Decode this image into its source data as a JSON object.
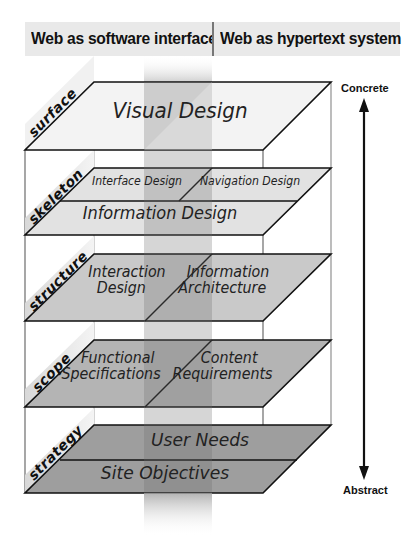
{
  "header": {
    "left": "Web as software interface",
    "right": "Web as hypertext system"
  },
  "axis": {
    "top": "Concrete",
    "bottom": "Abstract"
  },
  "planes": [
    {
      "name": "surface",
      "label": "surface",
      "elements": [
        "Visual Design"
      ]
    },
    {
      "name": "skeleton",
      "label": "skeleton",
      "elements": [
        "Interface Design",
        "Navigation Design",
        "Information Design"
      ]
    },
    {
      "name": "structure",
      "label": "structure",
      "elements": [
        "Interaction Design",
        "Information Architecture"
      ],
      "lines": [
        [
          "Interaction",
          "Design"
        ],
        [
          "Information",
          "Architecture"
        ]
      ]
    },
    {
      "name": "scope",
      "label": "scope",
      "elements": [
        "Functional Specifications",
        "Content Requirements"
      ],
      "lines": [
        [
          "Functional",
          "Specifications"
        ],
        [
          "Content",
          "Requirements"
        ]
      ]
    },
    {
      "name": "strategy",
      "label": "strategy",
      "elements": [
        "User Needs",
        "Site Objectives"
      ]
    }
  ],
  "colors": {
    "surface": "#f2f2f2",
    "skeleton": "#e2e2e2",
    "structure": "#c8c8c8",
    "scope": "#b2b2b2",
    "strategy": "#9a9a9a",
    "band": "#8a8a8a",
    "header_bg": "#e9e9e9"
  }
}
